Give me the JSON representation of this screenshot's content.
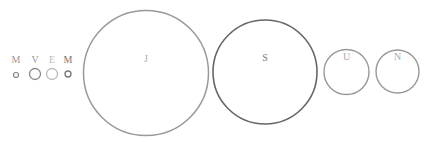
{
  "planets": [
    {
      "name": "Mercury",
      "label": "M",
      "cx": 16,
      "cy": 75,
      "r": 2.5,
      "stroke": "#888888",
      "stroke_width": 1.2,
      "label_color": "#999999",
      "label_y": 63
    },
    {
      "name": "Venus",
      "label": "V",
      "cx": 35,
      "cy": 74,
      "r": 5.5,
      "stroke": "#888888",
      "stroke_width": 1.3,
      "label_color": "#999999",
      "label_y": 63
    },
    {
      "name": "Earth",
      "label": "E",
      "cx": 52,
      "cy": 74,
      "r": 5.5,
      "stroke": "#bbbbbb",
      "stroke_width": 1.3,
      "label_color": "#bbbbbb",
      "label_y": 63
    },
    {
      "name": "Mars",
      "label": "M",
      "cx": 68,
      "cy": 74,
      "r": 3,
      "stroke": "#777777",
      "stroke_width": 1.3,
      "label_color": "#777777",
      "label_y": 63
    },
    {
      "name": "Jupiter",
      "label": "J",
      "cx": 146,
      "cy": 73,
      "r": 62.5,
      "stroke": "#999999",
      "stroke_width": 1.5,
      "label_color": "#aaaaaa",
      "label_y": 62
    },
    {
      "name": "Saturn",
      "label": "S",
      "cx": 265,
      "cy": 72,
      "r": 52,
      "stroke": "#666666",
      "stroke_width": 1.6,
      "label_color": "#777777",
      "label_y": 61
    },
    {
      "name": "Uranus",
      "label": "U",
      "cx": 346.5,
      "cy": 72,
      "r": 22.5,
      "stroke": "#999999",
      "stroke_width": 1.4,
      "label_color": "#aaaaaa",
      "label_y": 60
    },
    {
      "name": "Neptune",
      "label": "N",
      "cx": 397.5,
      "cy": 71.5,
      "r": 21.5,
      "stroke": "#999999",
      "stroke_width": 1.4,
      "label_color": "#aaaaaa",
      "label_y": 60
    }
  ]
}
